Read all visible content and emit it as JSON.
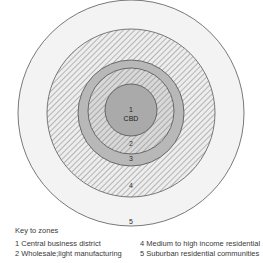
{
  "diagram": {
    "center_label_number": "1",
    "center_label_text": "CBD",
    "zone_markers": [
      {
        "id": "zone-2",
        "label": "2",
        "x": 131,
        "y": 144
      },
      {
        "id": "zone-3",
        "label": "3",
        "x": 131,
        "y": 158
      },
      {
        "id": "zone-4",
        "label": "4",
        "x": 131,
        "y": 184
      },
      {
        "id": "zone-5",
        "label": "5",
        "x": 131,
        "y": 220
      }
    ],
    "rings": [
      {
        "id": "zone-5",
        "label": "5",
        "radius": 114,
        "fill": "#f2f2f2",
        "pattern": "solid"
      },
      {
        "id": "zone-4",
        "label": "4",
        "radius": 84,
        "fill": "#e8e8e8",
        "pattern": "hatch"
      },
      {
        "id": "zone-3",
        "label": "3",
        "radius": 53,
        "fill": "#b8b8b8",
        "pattern": "solid"
      },
      {
        "id": "zone-2",
        "label": "2",
        "radius": 43,
        "fill": "#dcdcdc",
        "pattern": "hatch"
      },
      {
        "id": "zone-1",
        "label": "1",
        "radius": 26,
        "fill": "#aaaaaa",
        "pattern": "solid"
      }
    ],
    "colors": {
      "outline": "#555555",
      "cbd_fill": "#aaaaaa",
      "zone3_fill": "#b8b8b8",
      "zone5_fill": "#f2f2f2",
      "hatch_line": "#9a9a9a",
      "text": "#3a3a3a"
    }
  },
  "legend": {
    "title": "Key to zones",
    "left_entries": [
      "1 Central business district",
      "2 Wholesale;light manufacturing"
    ],
    "right_entries": [
      "4 Medium to high income residential",
      "5 Suburban residential communities"
    ]
  }
}
